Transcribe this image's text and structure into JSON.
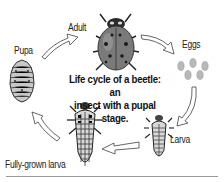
{
  "diagram": {
    "title_line1": "Life cycle of a beetle: an",
    "title_line2": "insect with a pupal stage.",
    "stages": [
      {
        "id": "adult",
        "label": "Adult"
      },
      {
        "id": "eggs",
        "label": "Eggs"
      },
      {
        "id": "larva",
        "label": "Larva"
      },
      {
        "id": "fully-grown-larva",
        "label": "Fully-grown larva"
      },
      {
        "id": "pupa",
        "label": "Pupa"
      }
    ],
    "flow": [
      "Adult",
      "Eggs",
      "Larva",
      "Fully-grown larva",
      "Pupa",
      "Adult"
    ],
    "colors": {
      "beetle_body": "#7a7a7a",
      "arrow_outline": "#555555",
      "rule": "#9a9a9a"
    }
  }
}
